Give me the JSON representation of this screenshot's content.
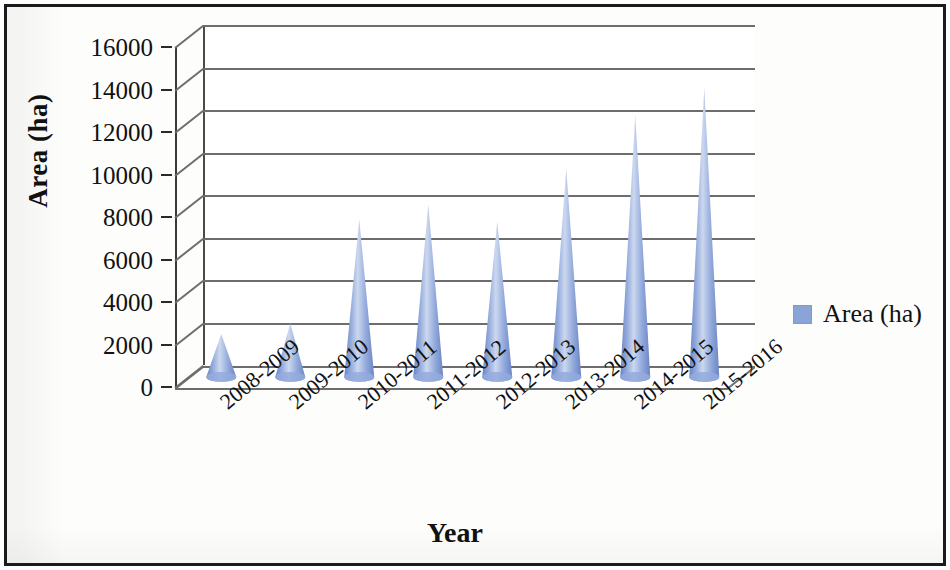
{
  "chart_data": {
    "type": "bar",
    "subtype": "3d-cone",
    "title": "",
    "xlabel": "Year",
    "ylabel": "Area (ha)",
    "categories": [
      "2008-2009",
      "2009-2010",
      "2010-2011",
      "2011-2012",
      "2012-2013",
      "2013-2014",
      "2014-2015",
      "2015-2016"
    ],
    "values": [
      2400,
      2900,
      7800,
      8500,
      7700,
      10200,
      12700,
      14000
    ],
    "series": [
      {
        "name": "Area (ha)",
        "values": [
          2400,
          2900,
          7800,
          8500,
          7700,
          10200,
          12700,
          14000
        ]
      }
    ],
    "ylim": [
      0,
      16000
    ],
    "ytick_labels": [
      "0",
      "2000",
      "4000",
      "6000",
      "8000",
      "10000",
      "12000",
      "14000",
      "16000"
    ],
    "ytick_values": [
      0,
      2000,
      4000,
      6000,
      8000,
      10000,
      12000,
      14000,
      16000
    ],
    "grid": true,
    "legend_position": "right",
    "legend_entries": [
      "Area (ha)"
    ],
    "series_color": "#8ba4d8"
  },
  "axes": {
    "y_title": "Area (ha)",
    "x_title": "Year"
  },
  "legend": {
    "swatch_name": "series-color-swatch",
    "label": "Area (ha)"
  },
  "colors": {
    "cone_light": "#ccd8ef",
    "cone_mid": "#93aadc",
    "cone_dark": "#6a85c4",
    "gridline": "#6d6d6d",
    "axis": "#3a3a3a",
    "border": "#1b1b1b",
    "text": "#111111"
  }
}
